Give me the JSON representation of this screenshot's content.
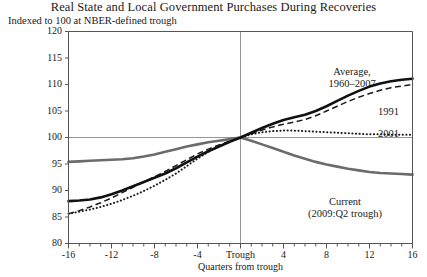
{
  "chart_data": {
    "type": "line",
    "title": "Real State and Local Government Purchases During Recoveries",
    "subtitle": "Indexed to 100 at NBER-defined trough",
    "xlabel": "Quarters from trough",
    "ylabel": "",
    "xlim": [
      -16,
      16
    ],
    "ylim": [
      80,
      120
    ],
    "yticks": [
      80,
      85,
      90,
      95,
      100,
      105,
      110,
      115,
      120
    ],
    "ytick_labels": [
      "80",
      "85",
      "90",
      "95",
      "100",
      "105",
      "110",
      "115",
      "120"
    ],
    "xticks": [
      -16,
      -12,
      -8,
      -4,
      0,
      4,
      8,
      12,
      16
    ],
    "xtick_labels": [
      "-16",
      "-12",
      "-8",
      "-4",
      "Trough",
      "4",
      "8",
      "12",
      "16"
    ],
    "minor_xtick_step": 1,
    "grid": "reference line at y=100 and vertical line at trough (x=0)",
    "legend": "inline annotations next to each series",
    "x": [
      -16,
      -15,
      -14,
      -13,
      -12,
      -11,
      -10,
      -9,
      -8,
      -7,
      -6,
      -5,
      -4,
      -3,
      -2,
      -1,
      0,
      1,
      2,
      3,
      4,
      5,
      6,
      7,
      8,
      9,
      10,
      11,
      12,
      13,
      14,
      15,
      16
    ],
    "series": [
      {
        "name": "Average, 1960–2007",
        "style": "solid-thick-black",
        "color": "#111111",
        "values": [
          88.0,
          88.1,
          88.3,
          88.7,
          89.3,
          90.0,
          90.8,
          91.6,
          92.4,
          93.2,
          94.2,
          95.3,
          96.4,
          97.4,
          98.3,
          99.2,
          100.0,
          100.9,
          101.8,
          102.6,
          103.3,
          103.8,
          104.3,
          105.0,
          105.9,
          106.9,
          107.9,
          108.8,
          109.6,
          110.2,
          110.6,
          110.9,
          111.1
        ]
      },
      {
        "name": "1991",
        "style": "dashed-black",
        "color": "#1a1a1a",
        "values": [
          85.6,
          86.2,
          86.9,
          87.7,
          88.6,
          89.6,
          90.6,
          91.6,
          92.6,
          93.6,
          94.7,
          95.8,
          96.9,
          97.8,
          98.6,
          99.3,
          100.0,
          100.7,
          101.4,
          102.0,
          102.5,
          102.9,
          103.4,
          104.1,
          105.0,
          105.9,
          106.8,
          107.6,
          108.3,
          108.9,
          109.4,
          109.7,
          110.0
        ]
      },
      {
        "name": "2001",
        "style": "dotted-black",
        "color": "#1a1a1a",
        "values": [
          85.6,
          86.0,
          86.4,
          86.9,
          87.5,
          88.2,
          89.0,
          89.9,
          90.9,
          92.0,
          93.2,
          94.6,
          96.0,
          97.3,
          98.3,
          99.2,
          100.0,
          100.6,
          101.0,
          101.2,
          101.3,
          101.3,
          101.2,
          101.1,
          101.0,
          100.9,
          100.8,
          100.7,
          100.6,
          100.6,
          100.5,
          100.5,
          100.5
        ]
      },
      {
        "name": "Current (2009:Q2 trough)",
        "style": "solid-thick-gray",
        "color": "#6b6b6b",
        "values": [
          95.4,
          95.5,
          95.6,
          95.7,
          95.8,
          95.9,
          96.1,
          96.4,
          96.8,
          97.3,
          97.8,
          98.3,
          98.7,
          99.1,
          99.4,
          99.7,
          100.0,
          99.4,
          98.7,
          98.0,
          97.3,
          96.6,
          96.0,
          95.4,
          94.9,
          94.5,
          94.1,
          93.8,
          93.5,
          93.3,
          93.2,
          93.1,
          93.0
        ]
      }
    ],
    "annotations": [
      {
        "name": "average-label",
        "line1": "Average,",
        "line2": "1960–2007"
      },
      {
        "name": "y1991-label",
        "text": "1991"
      },
      {
        "name": "y2001-label",
        "text": "2001"
      },
      {
        "name": "current-label",
        "line1": "Current",
        "line2": "(2009:Q2 trough)"
      }
    ]
  },
  "colors": {
    "average": "#111111",
    "y1991": "#1a1a1a",
    "y2001": "#1a1a1a",
    "current": "#6b6b6b",
    "axis": "#555555",
    "reference": "#8a8a8a"
  }
}
